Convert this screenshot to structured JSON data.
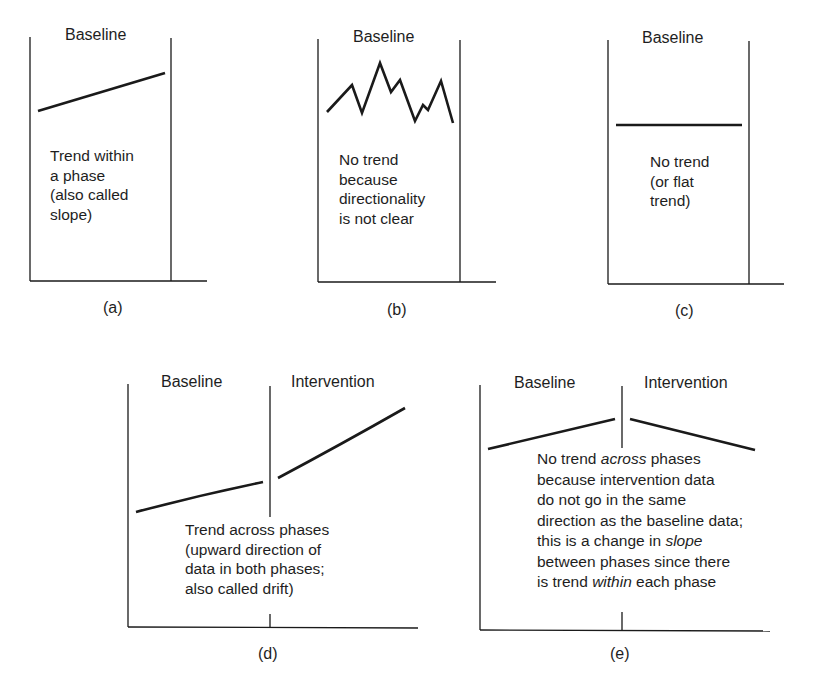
{
  "figure": {
    "panels": [
      {
        "id": "a",
        "caption": "(a)",
        "phase_labels": [
          "Baseline"
        ],
        "description_lines": [
          "Trend within",
          "a phase",
          "(also called",
          "slope)"
        ],
        "pattern": "upward straight line"
      },
      {
        "id": "b",
        "caption": "(b)",
        "phase_labels": [
          "Baseline"
        ],
        "description_lines": [
          "No trend",
          "because",
          "directionality",
          "is not clear"
        ],
        "pattern": "zigzag"
      },
      {
        "id": "c",
        "caption": "(c)",
        "phase_labels": [
          "Baseline"
        ],
        "description_lines": [
          "No trend",
          "(or flat",
          "trend)"
        ],
        "pattern": "flat line"
      },
      {
        "id": "d",
        "caption": "(d)",
        "phase_labels": [
          "Baseline",
          "Intervention"
        ],
        "description_lines": [
          "Trend across phases",
          "(upward direction of",
          "data in both phases;",
          "also called drift)"
        ],
        "pattern": "upward in both phases"
      },
      {
        "id": "e",
        "caption": "(e)",
        "phase_labels": [
          "Baseline",
          "Intervention"
        ],
        "description_segments": [
          [
            {
              "t": "No trend ",
              "i": false
            },
            {
              "t": "across",
              "i": true
            },
            {
              "t": " phases",
              "i": false
            }
          ],
          [
            {
              "t": "because intervention data",
              "i": false
            }
          ],
          [
            {
              "t": "do not go in the same",
              "i": false
            }
          ],
          [
            {
              "t": "direction as the baseline data;",
              "i": false
            }
          ],
          [
            {
              "t": "this is a change in ",
              "i": false
            },
            {
              "t": "slope",
              "i": true
            }
          ],
          [
            {
              "t": "between phases since there",
              "i": false
            }
          ],
          [
            {
              "t": "is trend ",
              "i": false
            },
            {
              "t": "within",
              "i": true
            },
            {
              "t": " each phase",
              "i": false
            }
          ]
        ],
        "pattern": "up in baseline, down in intervention"
      }
    ],
    "line_color": "#1a1a1a"
  }
}
